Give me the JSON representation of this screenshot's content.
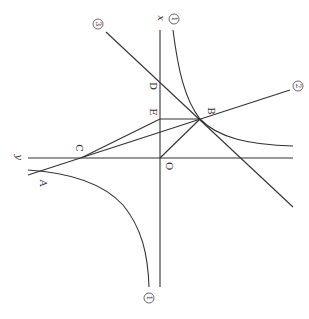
{
  "diagram": {
    "axes": {
      "x_label": "x",
      "y_label": "y",
      "origin_label": "O"
    },
    "points": [
      {
        "label": "A",
        "x": 38,
        "y": 172,
        "lx": 42,
        "ly": 183
      },
      {
        "label": "B",
        "x": 200,
        "y": 119,
        "lx": 210,
        "ly": 111
      },
      {
        "label": "C",
        "x": 81,
        "y": 158,
        "lx": 78,
        "ly": 148
      },
      {
        "label": "D",
        "x": 160,
        "y": 82,
        "lx": 152,
        "ly": 86
      },
      {
        "label": "E",
        "x": 160,
        "y": 119,
        "lx": 152,
        "ly": 112
      },
      {
        "label": "O",
        "x": 160,
        "y": 158,
        "lx": 168,
        "ly": 166
      }
    ],
    "curve_labels": {
      "hyperbola_top": "1",
      "hyperbola_bottom": "1",
      "line2": "2",
      "line3": "3"
    },
    "colors": {
      "stroke": "#333333",
      "background": "#ffffff"
    }
  }
}
